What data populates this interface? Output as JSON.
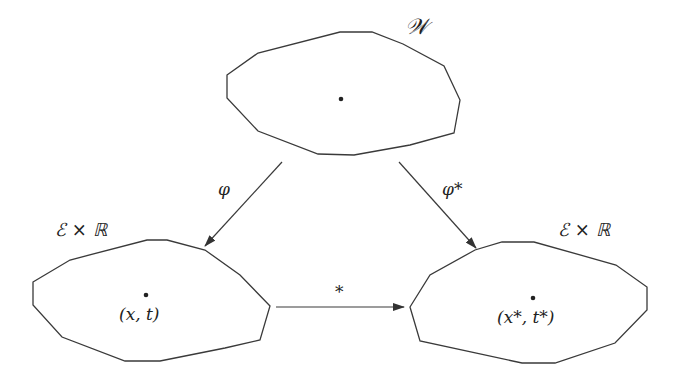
{
  "diagram": {
    "type": "commutative-diagram",
    "nodes": {
      "top": {
        "label": "𝒲",
        "point": ""
      },
      "left": {
        "label": "ℰ × ℝ",
        "point": "(x, t)"
      },
      "right": {
        "label": "ℰ × ℝ",
        "point": "(x*, t*)"
      }
    },
    "edges": {
      "phi": {
        "from": "top",
        "to": "left",
        "label": "φ"
      },
      "phi_star": {
        "from": "top",
        "to": "right",
        "label": "φ*"
      },
      "star": {
        "from": "left",
        "to": "right",
        "label": "*"
      }
    },
    "colors": {
      "stroke": "#3a3a3a",
      "background": "#ffffff"
    }
  }
}
